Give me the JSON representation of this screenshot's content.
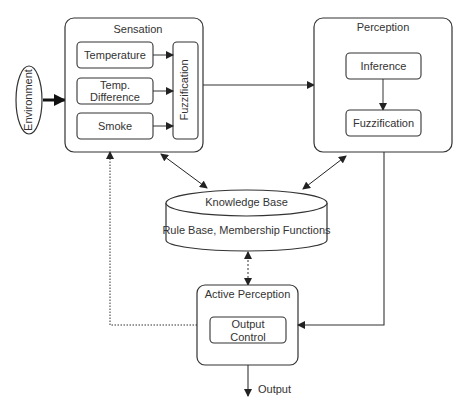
{
  "diagram": {
    "environment": {
      "label": "Environment"
    },
    "sensation": {
      "title": "Sensation",
      "inputs": [
        {
          "label": "Temperature"
        },
        {
          "label_line1": "Temp.",
          "label_line2": "Difference"
        },
        {
          "label": "Smoke"
        }
      ],
      "fuzzification": "Fuzzification"
    },
    "perception": {
      "title": "Perception",
      "inference": "Inference",
      "fuzzification": "Fuzzification"
    },
    "knowledge_base": {
      "title": "Knowledge Base",
      "subtitle": "Rule Base, Membership Functions"
    },
    "active_perception": {
      "title": "Active Perception",
      "output_control_line1": "Output",
      "output_control_line2": "Control"
    },
    "output": {
      "label": "Output"
    },
    "colors": {
      "stroke": "#333333",
      "text": "#333333",
      "background": "#ffffff"
    }
  }
}
